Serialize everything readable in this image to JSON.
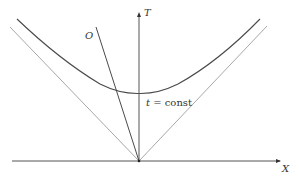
{
  "diagram": {
    "type": "spacetime diagram",
    "axes": {
      "time_label": "T",
      "space_label": "X"
    },
    "observer_label": "O",
    "curve_label_var": "t",
    "curve_label_rest": " = const",
    "elements": [
      {
        "name": "T-axis",
        "kind": "arrow",
        "direction": "up"
      },
      {
        "name": "X-axis",
        "kind": "arrow",
        "direction": "right"
      },
      {
        "name": "left light-cone line",
        "kind": "line"
      },
      {
        "name": "right light-cone line",
        "kind": "line"
      },
      {
        "name": "hyperbola t = const",
        "kind": "curve"
      },
      {
        "name": "observer worldline O",
        "kind": "line"
      }
    ],
    "colors": {
      "axis": "#555555",
      "light_cone": "#a8a8a8",
      "hyperbola": "#4a4a4a",
      "worldline": "#4a4a4a",
      "text": "#333333"
    }
  }
}
